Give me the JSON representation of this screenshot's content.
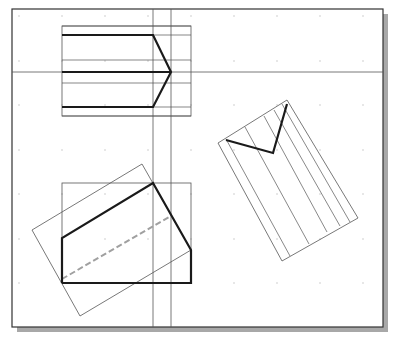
{
  "drawing": {
    "description": "CAD sheet with orthographic views: a pentagon-ended bar (top view), a rotated auxiliary view with V notch, and a front view with a tilted bounding rectangle and hidden (dashed) line",
    "colors": {
      "background": "#ffffff",
      "frame": "#333333",
      "shadow": "#a8a8a8",
      "construction_line": "#555555",
      "object_line": "#1a1a1a",
      "hidden_line": "#a0a0a0",
      "grid_dot": "#bdbdbd"
    },
    "frame": {
      "x": 12,
      "y": 9,
      "width": 371,
      "height": 318
    },
    "grid": {
      "x": [
        19,
        62,
        105,
        148,
        191,
        234,
        277,
        320,
        363
      ],
      "y": [
        16,
        61,
        105,
        150,
        194,
        239,
        283
      ]
    },
    "projection_lines": {
      "horizontal_y": 72,
      "vertical_x": [
        153,
        171
      ]
    },
    "top_view": {
      "box": {
        "x": 62,
        "y": 26,
        "width": 129,
        "height": 90
      },
      "thin_lines_y": [
        26,
        35,
        60,
        83,
        107,
        116
      ],
      "object_path": [
        [
          62,
          35
        ],
        [
          153,
          35
        ],
        [
          171,
          72
        ],
        [
          153,
          107
        ],
        [
          62,
          107
        ]
      ],
      "center_line": [
        [
          62,
          72
        ],
        [
          171,
          72
        ]
      ]
    },
    "auxiliary_view": {
      "outline": [
        [
          218,
          143
        ],
        [
          287,
          100
        ],
        [
          358,
          218
        ],
        [
          282,
          261
        ]
      ],
      "fold_lines": [
        [
          [
            226,
            139
          ],
          [
            290,
            256
          ]
        ],
        [
          [
            245,
            127
          ],
          [
            309,
            244
          ]
        ],
        [
          [
            264,
            116
          ],
          [
            327,
            232
          ]
        ],
        [
          [
            274,
            110
          ],
          [
            340,
            226
          ]
        ],
        [
          [
            282,
            104
          ],
          [
            350,
            222
          ]
        ]
      ],
      "v_notch": [
        [
          226,
          140
        ],
        [
          273,
          153
        ],
        [
          287,
          104
        ]
      ]
    },
    "front_view": {
      "box": {
        "x": 62,
        "y": 183,
        "width": 129,
        "height": 100
      },
      "tilted_box": [
        [
          32,
          230
        ],
        [
          142,
          164
        ],
        [
          191,
          250
        ],
        [
          80,
          316
        ]
      ],
      "object_path": [
        [
          62,
          283
        ],
        [
          62,
          238
        ],
        [
          153,
          183
        ],
        [
          191,
          250
        ],
        [
          191,
          283
        ],
        [
          62,
          283
        ]
      ],
      "hidden_line": [
        [
          62,
          279
        ],
        [
          171,
          216
        ]
      ]
    }
  }
}
